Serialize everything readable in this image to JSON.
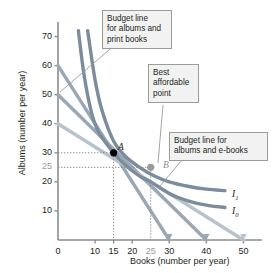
{
  "chart_data": {
    "type": "line",
    "title": "",
    "xlabel": "Books (number per year)",
    "ylabel": "Albums (number per year)",
    "xlim": [
      0,
      55
    ],
    "ylim": [
      0,
      75
    ],
    "grid": false,
    "legend_position": "inline-annotations",
    "xticks": [
      {
        "value": 0,
        "label": "0",
        "muted": false
      },
      {
        "value": 10,
        "label": "10",
        "muted": false
      },
      {
        "value": 15,
        "label": "15",
        "muted": false
      },
      {
        "value": 20,
        "label": "20",
        "muted": false
      },
      {
        "value": 25,
        "label": "25",
        "muted": true
      },
      {
        "value": 30,
        "label": "30",
        "muted": false
      },
      {
        "value": 40,
        "label": "40",
        "muted": false
      },
      {
        "value": 50,
        "label": "50",
        "muted": false
      }
    ],
    "yticks": [
      {
        "value": 10,
        "label": "10",
        "muted": false
      },
      {
        "value": 20,
        "label": "20",
        "muted": false
      },
      {
        "value": 25,
        "label": "25",
        "muted": true
      },
      {
        "value": 30,
        "label": "30",
        "muted": false
      },
      {
        "value": 40,
        "label": "40",
        "muted": false
      },
      {
        "value": 50,
        "label": "50",
        "muted": false
      },
      {
        "value": 60,
        "label": "60",
        "muted": false
      },
      {
        "value": 70,
        "label": "70",
        "muted": false
      }
    ],
    "series": [
      {
        "name": "Budget line for albums and print books",
        "kind": "budget-line",
        "color": "#9aa7b4",
        "points": [
          [
            0,
            60
          ],
          [
            30,
            0
          ]
        ]
      },
      {
        "name": "Budget line (middle)",
        "kind": "budget-line",
        "color": "#9aa7b4",
        "points": [
          [
            0,
            50
          ],
          [
            40,
            0
          ]
        ]
      },
      {
        "name": "Budget line for albums and e-books",
        "kind": "budget-line",
        "color": "#b9c2cb",
        "points": [
          [
            0,
            40
          ],
          [
            50,
            0
          ]
        ]
      },
      {
        "name": "I1",
        "kind": "indifference-curve",
        "color": "#7b8c9c",
        "points": [
          [
            8,
            72
          ],
          [
            10,
            55
          ],
          [
            12,
            44
          ],
          [
            15,
            34
          ],
          [
            18,
            29
          ],
          [
            22,
            25
          ],
          [
            26,
            22
          ],
          [
            30,
            20
          ],
          [
            35,
            18.5
          ],
          [
            40,
            17.5
          ],
          [
            45,
            17
          ]
        ]
      },
      {
        "name": "I0",
        "kind": "indifference-curve",
        "color": "#7b8c9c",
        "points": [
          [
            5.5,
            72
          ],
          [
            7,
            57
          ],
          [
            9,
            44
          ],
          [
            11,
            37
          ],
          [
            15,
            30
          ],
          [
            18,
            26
          ],
          [
            22,
            22
          ],
          [
            25,
            20
          ],
          [
            30,
            16
          ],
          [
            35,
            13.5
          ],
          [
            40,
            12
          ],
          [
            45,
            11.2
          ]
        ]
      }
    ],
    "curve_labels": [
      {
        "name": "I1",
        "text": "I",
        "sub": "1"
      },
      {
        "name": "I0",
        "text": "I",
        "sub": "0"
      }
    ],
    "points": [
      {
        "name": "A",
        "label": "A",
        "x": 15,
        "y": 30,
        "color": "#000000",
        "filled": true
      },
      {
        "name": "B",
        "label": "B",
        "x": 25,
        "y": 25,
        "color": "#9a9a9a",
        "filled": true
      }
    ],
    "dropline_color": "#8d8d8d",
    "annotations": [
      {
        "name": "budget-line-print-books",
        "text": "Budget line\nfor albums and\nprint books"
      },
      {
        "name": "best-affordable-point",
        "text": "Best\naffordable\npoint"
      },
      {
        "name": "budget-line-ebooks",
        "text": "Budget line for\nalbums and e-books"
      }
    ]
  }
}
